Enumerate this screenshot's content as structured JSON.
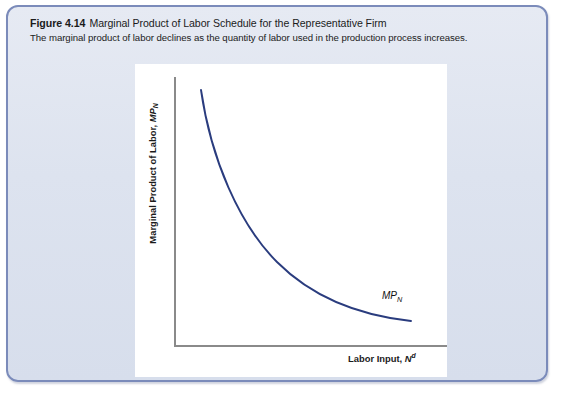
{
  "figure": {
    "number": "Figure 4.14",
    "title": "Marginal Product of Labor Schedule for the Representative Firm",
    "subtitle": "The marginal product of labor declines as the quantity of labor used in the production process increases."
  },
  "colors": {
    "card_border": "#7b8bba",
    "card_background": "#dfe5f0",
    "panel_background": "#ffffff",
    "curve": "#2a3c7e",
    "axis": "#8a8a8a",
    "text": "#1b1b1b"
  },
  "axis": {
    "y_label_text": "Marginal Product of Labor, ",
    "y_label_var": "MP",
    "y_label_sub": "N",
    "x_label_text": "Labor Input, ",
    "x_label_var": "N",
    "x_label_sup": "d"
  },
  "curve": {
    "label_var": "MP",
    "label_sub": "N",
    "path": "M 66 26 C 76 95, 104 160, 142 198 C 180 236, 230 252, 276 257"
  },
  "chart_data": {
    "type": "line",
    "title": "Marginal Product of Labor Schedule for the Representative Firm",
    "subtitle": "The marginal product of labor declines as the quantity of labor used in the production process increases.",
    "xlabel": "Labor Input, N^d",
    "ylabel": "Marginal Product of Labor, MP_N",
    "grid": false,
    "legend": "none",
    "axis_ticks": [],
    "xlim": [
      0,
      1
    ],
    "ylim": [
      0,
      1
    ],
    "series": [
      {
        "name": "MP_N",
        "annotation": "MP_N",
        "x": [
          0.1,
          0.16,
          0.23,
          0.3,
          0.38,
          0.47,
          0.56,
          0.66,
          0.76,
          0.87,
          0.98
        ],
        "y": [
          0.95,
          0.74,
          0.57,
          0.45,
          0.36,
          0.29,
          0.24,
          0.19,
          0.16,
          0.13,
          0.11
        ]
      }
    ]
  }
}
